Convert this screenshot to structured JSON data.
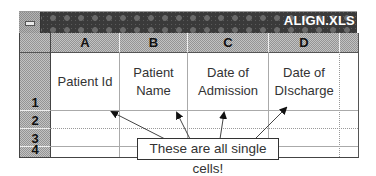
{
  "window": {
    "title": "ALIGN.XLS",
    "system_menu_icon": "minus-icon"
  },
  "sheet": {
    "columns": [
      "A",
      "B",
      "C",
      "D"
    ],
    "rows": [
      "1",
      "2",
      "3",
      "4"
    ],
    "cells": {
      "A1": "Patient Id",
      "B1_line1": "Patient",
      "B1_line2": "Name",
      "C1_line1": "Date of",
      "C1_line2": "Admission",
      "D1_line1": "Date of",
      "D1_line2": "DIscharge"
    }
  },
  "annotation": {
    "callout_text": "These are all single cells!"
  },
  "colors": {
    "titlebar": "#3a3a3a",
    "header": "#a8a8a8",
    "gridline": "#999999",
    "text": "#333333"
  }
}
